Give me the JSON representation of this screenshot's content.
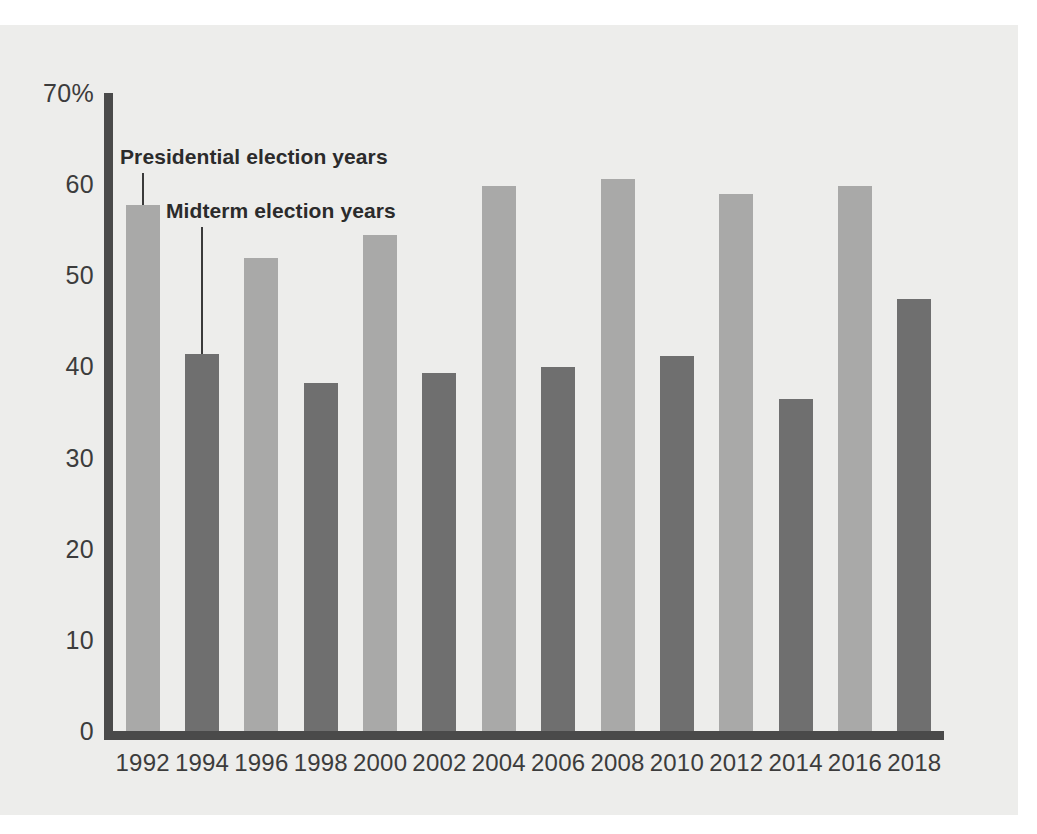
{
  "chart_data": {
    "type": "bar",
    "title": "",
    "subtitle": "",
    "xlabel": "",
    "ylabel": "",
    "ylim": [
      0,
      70
    ],
    "yunit": "%",
    "grid": false,
    "legend_position": "in-plot-annotations",
    "categories": [
      "1992",
      "1994",
      "1996",
      "1998",
      "2000",
      "2002",
      "2004",
      "2006",
      "2008",
      "2010",
      "2012",
      "2014",
      "2016",
      "2018"
    ],
    "values": [
      57.7,
      41.4,
      51.9,
      38.2,
      54.4,
      39.3,
      59.8,
      39.9,
      60.6,
      41.2,
      58.9,
      36.4,
      59.8,
      47.4
    ],
    "bar_types": [
      "presidential",
      "midterm",
      "presidential",
      "midterm",
      "presidential",
      "midterm",
      "presidential",
      "midterm",
      "presidential",
      "midterm",
      "presidential",
      "midterm",
      "presidential",
      "midterm"
    ],
    "series": [
      {
        "name": "Presidential election years",
        "color": "#a9a9a8",
        "points": [
          {
            "x": "1992",
            "y": 57.7
          },
          {
            "x": "1996",
            "y": 51.9
          },
          {
            "x": "2000",
            "y": 54.4
          },
          {
            "x": "2004",
            "y": 59.8
          },
          {
            "x": "2008",
            "y": 60.6
          },
          {
            "x": "2012",
            "y": 58.9
          },
          {
            "x": "2016",
            "y": 59.8
          }
        ]
      },
      {
        "name": "Midterm election years",
        "color": "#6f6f6f",
        "points": [
          {
            "x": "1994",
            "y": 41.4
          },
          {
            "x": "1998",
            "y": 38.2
          },
          {
            "x": "2002",
            "y": 39.3
          },
          {
            "x": "2006",
            "y": 39.9
          },
          {
            "x": "2010",
            "y": 41.2
          },
          {
            "x": "2014",
            "y": 36.4
          },
          {
            "x": "2018",
            "y": 47.4
          }
        ]
      }
    ],
    "yticks": [
      {
        "value": 70,
        "label": "70%"
      },
      {
        "value": 60,
        "label": "60"
      },
      {
        "value": 50,
        "label": "50"
      },
      {
        "value": 40,
        "label": "40"
      },
      {
        "value": 30,
        "label": "30"
      },
      {
        "value": 20,
        "label": "20"
      },
      {
        "value": 10,
        "label": "10"
      },
      {
        "value": 0,
        "label": "0"
      }
    ],
    "annotations": [
      {
        "id": "presidential",
        "text": "Presidential election years",
        "target_category": "1992"
      },
      {
        "id": "midterm",
        "text": "Midterm election years",
        "target_category": "1994"
      }
    ]
  },
  "colors": {
    "background": "#ffffff",
    "plot_background": "#ededeb",
    "axis": "#4a4a4a",
    "presidential_bar": "#a9a9a8",
    "midterm_bar": "#6f6f6f",
    "text": "#3c3c3c",
    "annotation_text": "#2b2b2b"
  }
}
